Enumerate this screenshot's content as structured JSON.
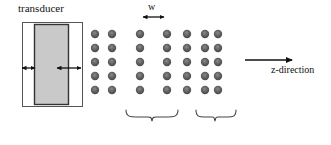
{
  "figure": {
    "labels": {
      "transducer": "transducer",
      "z_direction": "z-direction",
      "width_symbol": "w"
    },
    "colors": {
      "background": "#ffffff",
      "dot_fill": "#555555",
      "dot_highlight": "#8a8a8a",
      "transducer_fill": "#c9c9c9",
      "transducer_outline": "#333333",
      "housing_fill": "#ffffff",
      "housing_outline": "#555555",
      "line": "#222222",
      "brace": "#444444"
    },
    "transducer": {
      "housing": {
        "x": 22,
        "y": 22,
        "width": 60,
        "height": 84
      },
      "element": {
        "x": 34,
        "y": 24,
        "width": 34,
        "height": 80
      },
      "gap_arrows": [
        {
          "name": "left-gap-arrow",
          "x1": 22,
          "x2": 34,
          "y": 68
        },
        {
          "name": "right-gap-arrow",
          "x1": 56,
          "x2": 80,
          "y": 68
        }
      ]
    },
    "dot_grid": {
      "rows": 5,
      "row_y": [
        34,
        48,
        62,
        76,
        90
      ],
      "column_x": [
        95,
        112,
        140,
        167,
        187,
        205,
        218
      ],
      "dot_radius": 4.2,
      "total_dots": 35
    },
    "w_measure": {
      "x1": 143,
      "x2": 163,
      "y": 17
    },
    "z_arrow": {
      "x1": 245,
      "x2": 292,
      "y": 60
    },
    "braces": [
      {
        "name": "brace-left",
        "x1": 126,
        "x2": 178,
        "y": 112,
        "depth": 9
      },
      {
        "name": "brace-right",
        "x1": 196,
        "x2": 236,
        "y": 112,
        "depth": 9
      }
    ]
  }
}
